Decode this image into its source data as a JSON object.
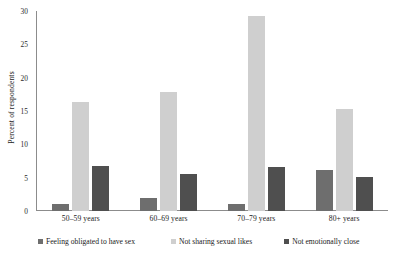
{
  "chart_data": {
    "type": "bar",
    "title": "",
    "subtitle": "",
    "xlabel": "",
    "ylabel": "Percent of respondents",
    "ylim": [
      0,
      30
    ],
    "yticks": [
      0,
      5,
      10,
      15,
      20,
      25,
      30
    ],
    "ytick_labels": [
      "0",
      "5",
      "10",
      "15",
      "20",
      "25",
      "30"
    ],
    "grid": false,
    "legend_position": "bottom",
    "categories": [
      "50–59 years",
      "60–69 years",
      "70–79 years",
      "80+ years"
    ],
    "series": [
      {
        "name": "Feeling obligated to have sex",
        "color": "#6e6e6e",
        "values": [
          1.0,
          2.0,
          1.1,
          6.2
        ]
      },
      {
        "name": "Not sharing sexual likes",
        "color": "#cfcfcf",
        "values": [
          16.3,
          17.8,
          29.2,
          15.3
        ]
      },
      {
        "name": "Not emotionally close",
        "color": "#4f4f4f",
        "values": [
          6.7,
          5.6,
          6.6,
          5.1
        ]
      }
    ]
  }
}
